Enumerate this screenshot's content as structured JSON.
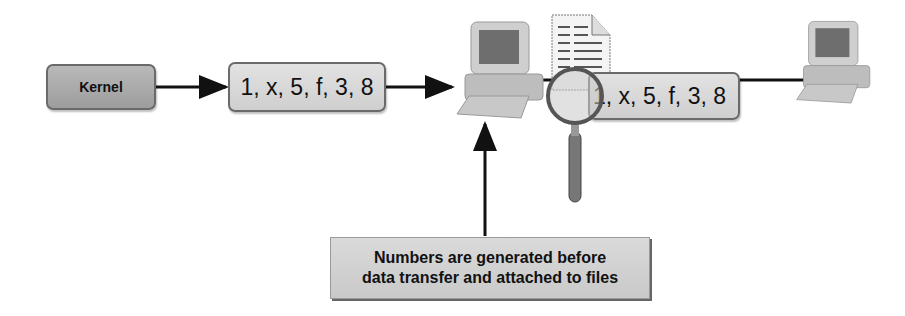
{
  "diagram": {
    "kernel": {
      "label": "Kernel"
    },
    "sequence_box_1": {
      "label": "1, x, 5, f, 3, 8"
    },
    "sequence_box_2": {
      "label": "1, x, 5, f, 3, 8"
    },
    "caption": {
      "line1": "Numbers are generated before",
      "line2": "data transfer and attached to files"
    },
    "icons": [
      "computer-icon",
      "document-icon",
      "magnifier-icon",
      "computer-icon"
    ],
    "colors": {
      "box_fill": "#d6d6d6",
      "kernel_fill": "#a9a9a9",
      "border": "#6a6a6a",
      "arrow": "#111111"
    }
  }
}
